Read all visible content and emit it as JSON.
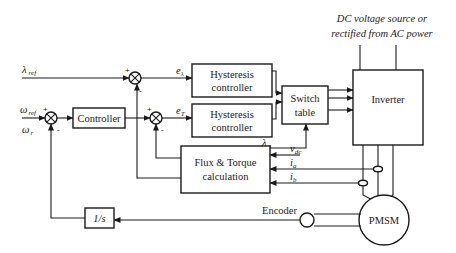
{
  "top_label": {
    "line1": "DC voltage source or",
    "line2": "rectified from AC power"
  },
  "inputs": {
    "lambda_ref": "λ",
    "lambda_ref_sub": "ref",
    "omega_ref": "ω",
    "omega_ref_sub": "ref",
    "omega_r": "ω",
    "omega_r_sub": "r"
  },
  "blocks": {
    "controller": "Controller",
    "hyst1_line1": "Hysteresis",
    "hyst1_line2": "controller",
    "hyst2_line1": "Hysteresis",
    "hyst2_line2": "controller",
    "switch_line1": "Switch",
    "switch_line2": "table",
    "inverter": "Inverter",
    "flux_line1": "Flux & Torque",
    "flux_line2": "calculation",
    "integrator": "1/s",
    "motor": "PMSM"
  },
  "signals": {
    "e_lambda": "e",
    "e_lambda_sub": "λ",
    "e_t": "e",
    "e_t_sub": "T",
    "lambda_s": "λ",
    "lambda_s_sub": "s",
    "v_dc": "v",
    "v_dc_sub": "dc",
    "i_a": "i",
    "i_a_sub": "a",
    "i_b": "i",
    "i_b_sub": "b",
    "encoder": "Encoder"
  },
  "signs": {
    "plus": "+",
    "minus": "-"
  }
}
